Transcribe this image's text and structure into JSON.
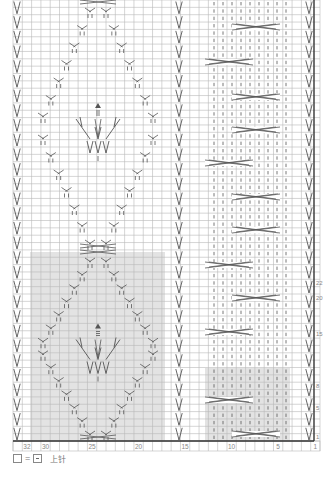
{
  "chart_title": "Knitting stitch chart",
  "grid": {
    "columns": 33,
    "rows": 60,
    "left_px": 13,
    "right_px": 320,
    "top_px": 0,
    "bottom_px": 441,
    "grid_color": "#b9b9b9",
    "thick_line_color": "#333333",
    "shade_color": "#e3e3e3",
    "symbol_color": "#555555"
  },
  "column_labels": [
    {
      "col": 32,
      "label": "32"
    },
    {
      "col": 30,
      "label": "30"
    },
    {
      "col": 25,
      "label": "25"
    },
    {
      "col": 20,
      "label": "20"
    },
    {
      "col": 15,
      "label": "15"
    },
    {
      "col": 10,
      "label": "10"
    },
    {
      "col": 5,
      "label": "5"
    },
    {
      "col": 1,
      "label": "1"
    }
  ],
  "row_labels": [
    {
      "row": 22,
      "label": "22"
    },
    {
      "row": 20,
      "label": "20"
    },
    {
      "row": 15,
      "label": "15"
    },
    {
      "row": 8,
      "label": "8"
    },
    {
      "row": 5,
      "label": "5"
    },
    {
      "row": 1,
      "label": "1"
    }
  ],
  "shaded_regions": [
    {
      "name": "leaf-pattern-repeat",
      "x0": 30,
      "x1": 165,
      "y0": 252,
      "y1": 441
    },
    {
      "name": "cable-pattern-repeat",
      "x0": 205,
      "x1": 290,
      "y0": 368,
      "y1": 441
    }
  ],
  "slip_stitch_columns": [
    {
      "name": "left-edge",
      "x": 17
    },
    {
      "name": "center-15",
      "x": 179
    },
    {
      "name": "right-edge",
      "x": 309
    }
  ],
  "cable_panel": {
    "stitch_columns_x": [
      214,
      223,
      232,
      241,
      250,
      259,
      268,
      277,
      286
    ],
    "crosses": [
      {
        "x0": 232,
        "x1": 280,
        "y": 27
      },
      {
        "x0": 205,
        "x1": 253,
        "y": 62
      },
      {
        "x0": 232,
        "x1": 280,
        "y": 97
      },
      {
        "x0": 232,
        "x1": 280,
        "y": 130
      },
      {
        "x0": 205,
        "x1": 253,
        "y": 163
      },
      {
        "x0": 232,
        "x1": 280,
        "y": 197
      },
      {
        "x0": 232,
        "x1": 280,
        "y": 230
      },
      {
        "x0": 205,
        "x1": 253,
        "y": 265
      },
      {
        "x0": 232,
        "x1": 280,
        "y": 298
      },
      {
        "x0": 205,
        "x1": 253,
        "y": 332
      },
      {
        "x0": 205,
        "x1": 253,
        "y": 400
      },
      {
        "x0": 232,
        "x1": 280,
        "y": 434
      }
    ]
  },
  "leaf_panels": [
    {
      "name": "upper-leaf",
      "center_x": 98,
      "top_y": 0,
      "bottom_y": 250
    },
    {
      "name": "lower-leaf",
      "center_x": 98,
      "top_y": 250,
      "bottom_y": 441
    }
  ],
  "legend": {
    "equals": "=",
    "text": "上针"
  }
}
